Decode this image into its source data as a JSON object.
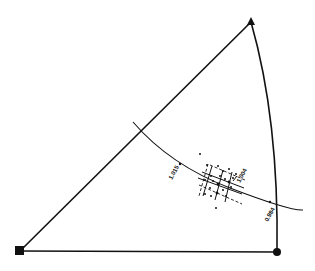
{
  "diagram": {
    "type": "stereographic-triangle",
    "corners": {
      "bottom_left": {
        "marker": "square"
      },
      "top": {
        "marker": "triangle"
      },
      "bottom_right": {
        "marker": "circle"
      }
    },
    "labels": {
      "left_tick": "1.015",
      "center_tick": "1.004",
      "right_tick": "0.984"
    },
    "scatter_point_count": 22
  }
}
